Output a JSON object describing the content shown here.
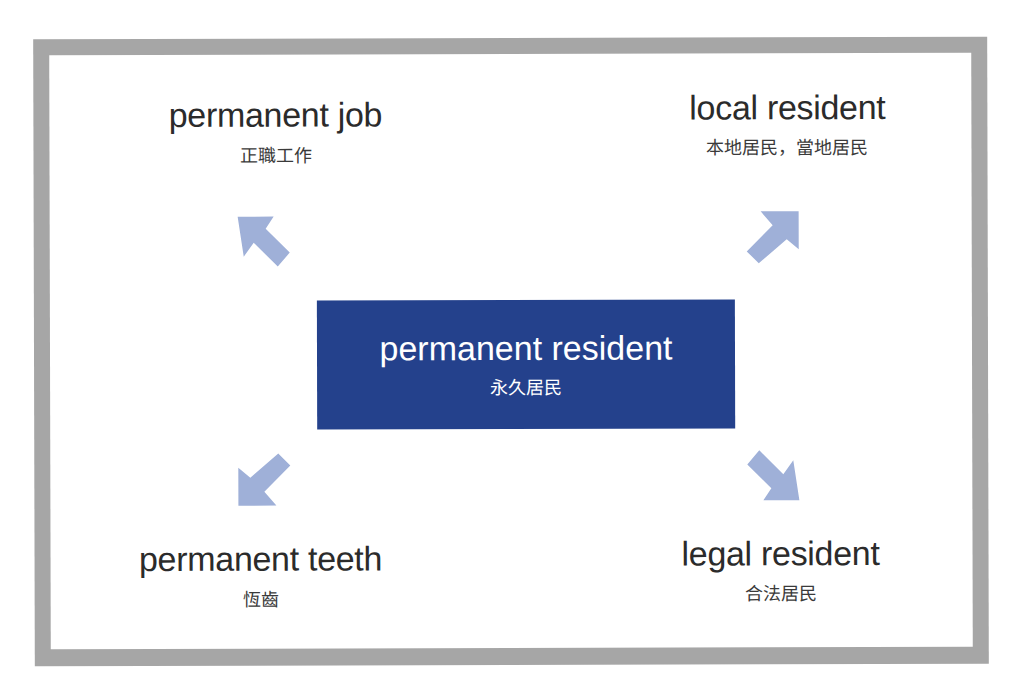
{
  "diagram": {
    "center": {
      "en": "permanent resident",
      "zh": "永久居民",
      "color": "#24418c"
    },
    "arrow_color": "#9fb0d8",
    "frame_color": "#a6a6a6",
    "terms": [
      {
        "position": "top-left",
        "en": "permanent job",
        "zh": "正職工作",
        "arrow": "arrow-up-left-icon"
      },
      {
        "position": "top-right",
        "en": "local resident",
        "zh": "本地居民，當地居民",
        "arrow": "arrow-up-right-icon"
      },
      {
        "position": "bottom-left",
        "en": "permanent teeth",
        "zh": "恆齒",
        "arrow": "arrow-down-left-icon"
      },
      {
        "position": "bottom-right",
        "en": "legal resident",
        "zh": "合法居民",
        "arrow": "arrow-down-right-icon"
      }
    ]
  }
}
